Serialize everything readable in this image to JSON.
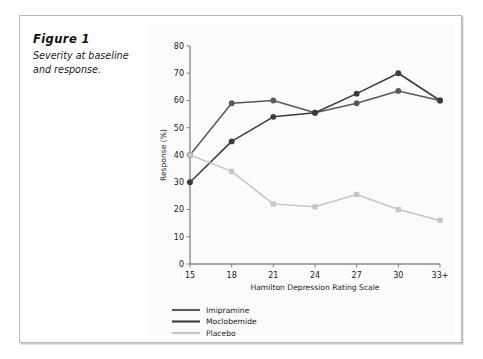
{
  "figure": {
    "title": "Figure 1",
    "caption": "Severity at baseline and response."
  },
  "chart_data": {
    "type": "line",
    "title": "",
    "xlabel": "Hamilton Depression Rating Scale",
    "ylabel": "Response (%)",
    "categories": [
      "15",
      "18",
      "21",
      "24",
      "27",
      "30",
      "33+"
    ],
    "xlim": [
      0,
      6
    ],
    "ylim": [
      0,
      80
    ],
    "yticks": [
      0,
      10,
      20,
      30,
      40,
      50,
      60,
      70,
      80
    ],
    "grid": false,
    "legend_position": "bottom-left",
    "series": [
      {
        "name": "Imipramine",
        "color": "#595959",
        "marker": "circle",
        "values": [
          40,
          59,
          60,
          55.5,
          59,
          63.5,
          60
        ]
      },
      {
        "name": "Moclobemide",
        "color": "#3b3b3b",
        "marker": "circle",
        "values": [
          30,
          45,
          54,
          55.5,
          62.5,
          70,
          60
        ]
      },
      {
        "name": "Placebo",
        "color": "#c6c6c6",
        "marker": "square",
        "values": [
          40,
          34,
          22,
          21,
          25.5,
          20,
          16
        ]
      }
    ]
  }
}
